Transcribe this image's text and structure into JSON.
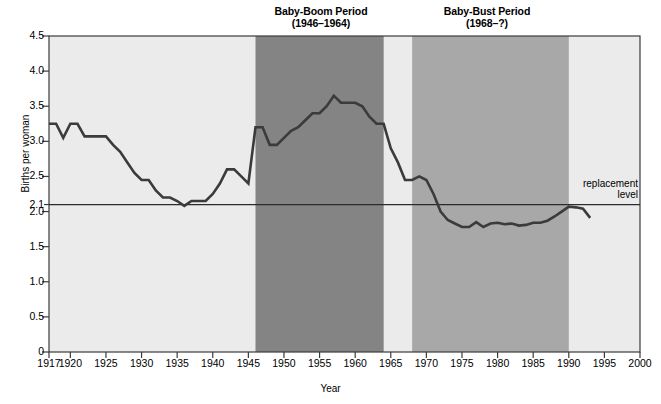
{
  "figure": {
    "kind": "line-chart",
    "bg_color": "#ffffff",
    "plot_bg_color": "#ebebeb",
    "band_boom_color": "#848484",
    "band_bust_color": "#a8a8a8",
    "line_color": "#3b3b3b",
    "axis_color": "#3b3b3b"
  },
  "annotations": {
    "boom_title_line1": "Baby-Boom Period",
    "boom_title_line2": "(1946–1964)",
    "bust_title_line1": "Baby-Bust Period",
    "bust_title_line2": "(1968–?)",
    "replacement_line1": "replacement",
    "replacement_line2": "level"
  },
  "axes": {
    "ylabel": "Births per woman",
    "xlabel": "Year",
    "yticks": [
      "0",
      "0.5",
      "1.0",
      "1.5",
      "2.0",
      "2.1",
      "2.5",
      "3.0",
      "3.5",
      "4.0",
      "4.5"
    ],
    "ytick_values": [
      0,
      0.5,
      1.0,
      1.5,
      2.0,
      2.1,
      2.5,
      3.0,
      3.5,
      4.0,
      4.5
    ],
    "xticks": [
      "1917",
      "1920",
      "1925",
      "1930",
      "1935",
      "1940",
      "1945",
      "1950",
      "1955",
      "1960",
      "1965",
      "1970",
      "1975",
      "1980",
      "1985",
      "1990",
      "1995",
      "2000"
    ],
    "xtick_values": [
      1917,
      1920,
      1925,
      1930,
      1935,
      1940,
      1945,
      1950,
      1955,
      1960,
      1965,
      1970,
      1975,
      1980,
      1985,
      1990,
      1995,
      2000
    ]
  },
  "chart_data": {
    "type": "line",
    "title": "",
    "xlabel": "Year",
    "ylabel": "Births per woman",
    "xlim": [
      1917,
      2000
    ],
    "ylim": [
      0,
      4.5
    ],
    "grid": false,
    "legend": null,
    "reference_lines": [
      {
        "name": "replacement level",
        "y": 2.1,
        "label": "replacement level"
      }
    ],
    "shaded_regions": [
      {
        "name": "Baby-Boom Period",
        "x0": 1946,
        "x1": 1964,
        "color": "#848484"
      },
      {
        "name": "Baby-Bust Period",
        "x0": 1968,
        "x1": 1990,
        "color": "#a8a8a8"
      }
    ],
    "series": [
      {
        "name": "Total fertility rate",
        "x": [
          1917,
          1918,
          1919,
          1920,
          1921,
          1922,
          1923,
          1924,
          1925,
          1926,
          1927,
          1928,
          1929,
          1930,
          1931,
          1932,
          1933,
          1934,
          1935,
          1936,
          1937,
          1938,
          1939,
          1940,
          1941,
          1942,
          1943,
          1944,
          1945,
          1946,
          1947,
          1948,
          1949,
          1950,
          1951,
          1952,
          1953,
          1954,
          1955,
          1956,
          1957,
          1958,
          1959,
          1960,
          1961,
          1962,
          1963,
          1964,
          1965,
          1966,
          1967,
          1968,
          1969,
          1970,
          1971,
          1972,
          1973,
          1974,
          1975,
          1976,
          1977,
          1978,
          1979,
          1980,
          1981,
          1982,
          1983,
          1984,
          1985,
          1986,
          1987,
          1988,
          1989,
          1990,
          1991,
          1992,
          1993
        ],
        "y": [
          3.25,
          3.25,
          3.05,
          3.25,
          3.25,
          3.07,
          3.07,
          3.07,
          3.07,
          2.95,
          2.85,
          2.7,
          2.55,
          2.45,
          2.45,
          2.3,
          2.2,
          2.2,
          2.15,
          2.08,
          2.15,
          2.15,
          2.15,
          2.25,
          2.4,
          2.6,
          2.6,
          2.5,
          2.4,
          3.2,
          3.2,
          2.95,
          2.95,
          3.05,
          3.15,
          3.2,
          3.3,
          3.4,
          3.4,
          3.5,
          3.65,
          3.55,
          3.55,
          3.55,
          3.5,
          3.35,
          3.25,
          3.25,
          2.9,
          2.7,
          2.45,
          2.45,
          2.5,
          2.45,
          2.25,
          2.0,
          1.88,
          1.83,
          1.78,
          1.78,
          1.85,
          1.78,
          1.83,
          1.84,
          1.82,
          1.83,
          1.8,
          1.81,
          1.84,
          1.84,
          1.87,
          1.93,
          2.0,
          2.07,
          2.06,
          2.04,
          1.91
        ]
      }
    ]
  },
  "geometry": {
    "plot_left": 49,
    "plot_right": 640,
    "plot_top": 36,
    "plot_bottom": 352
  }
}
